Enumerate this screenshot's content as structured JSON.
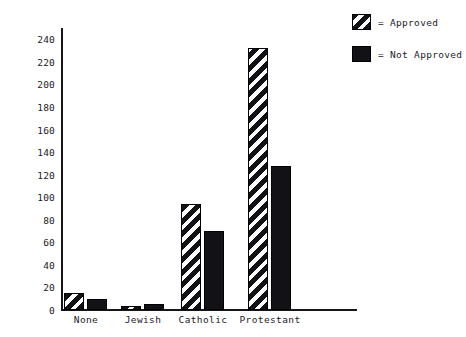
{
  "chart_data": {
    "type": "bar",
    "title": "",
    "subtitle": "",
    "xlabel": "",
    "ylabel": "",
    "categories": [
      "None",
      "Jewish",
      "Catholic",
      "Protestant"
    ],
    "series": [
      {
        "name": "Approved",
        "pattern": "diagonal-hatch",
        "values": [
          15,
          4,
          94,
          232
        ]
      },
      {
        "name": "Not Approved",
        "pattern": "solid",
        "values": [
          10,
          5,
          70,
          128
        ]
      }
    ],
    "ylim": [
      0,
      250
    ],
    "yticks": [
      0,
      20,
      40,
      60,
      80,
      100,
      120,
      140,
      160,
      180,
      200,
      220,
      240
    ],
    "ytick_labels": [
      "0",
      "20",
      "40",
      "60",
      "80",
      "100",
      "120",
      "140",
      "160",
      "180",
      "200",
      "220",
      "240"
    ],
    "grid": false,
    "legend": {
      "position": "top-right",
      "separator": "=",
      "entries": [
        {
          "label": "Approved",
          "swatch": "diagonal-hatch"
        },
        {
          "label": "Not Approved",
          "swatch": "solid"
        }
      ]
    },
    "colors": {
      "bar_fill": "#111116",
      "bar_edge": "#000000",
      "axis": "#15151a",
      "background": "#ffffff",
      "text": "#1a1a1f"
    }
  }
}
